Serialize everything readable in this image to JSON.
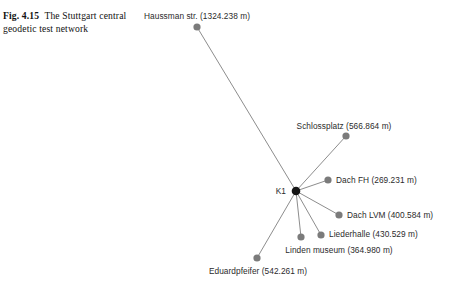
{
  "figure": {
    "label": "Fig. 4.15",
    "caption": "The Stuttgart central geodetic test network",
    "caption_line1": "The Stuttgart",
    "caption_line2": "central geodetic test network"
  },
  "colors": {
    "background": "#ffffff",
    "node": "#7b7b7b",
    "center_node": "#151515",
    "edge": "#8d8d8d",
    "label_text": "#2b2b2b",
    "caption_text": "#111111"
  },
  "chart_data": {
    "type": "scatter",
    "title": "The Stuttgart central geodetic test network",
    "xlabel": "",
    "ylabel": "",
    "legend": "none",
    "grid": false,
    "units": "m",
    "center_station": {
      "name": "K1",
      "label": "K1",
      "x": 296,
      "y": 191
    },
    "stations": [
      {
        "name": "Haussman str.",
        "distance_m": 1324.238,
        "label": "Haussman str. (1324.238 m)",
        "x": 197,
        "y": 27,
        "label_x": 197,
        "label_y": 16,
        "label_align": "center"
      },
      {
        "name": "Schlossplatz",
        "distance_m": 566.864,
        "label": "Schlossplatz (566.864 m)",
        "x": 346,
        "y": 136,
        "label_x": 344,
        "label_y": 126,
        "label_align": "center"
      },
      {
        "name": "Dach FH",
        "distance_m": 269.231,
        "label": "Dach FH (269.231 m)",
        "x": 328,
        "y": 180,
        "label_x": 336,
        "label_y": 180,
        "label_align": "right"
      },
      {
        "name": "Dach LVM",
        "distance_m": 400.584,
        "label": "Dach LVM (400.584 m)",
        "x": 339,
        "y": 215,
        "label_x": 347,
        "label_y": 215,
        "label_align": "right"
      },
      {
        "name": "Liederhalle",
        "distance_m": 430.529,
        "label": "Liederhalle (430.529 m)",
        "x": 321,
        "y": 235,
        "label_x": 329,
        "label_y": 234,
        "label_align": "right"
      },
      {
        "name": "Linden museum",
        "distance_m": 364.98,
        "label": "Linden museum (364.980 m)",
        "x": 301,
        "y": 237,
        "label_x": 339,
        "label_y": 250,
        "label_align": "center"
      },
      {
        "name": "Eduardpfeifer",
        "distance_m": 542.261,
        "label": "Eduardpfeifer (542.261 m)",
        "x": 257,
        "y": 258,
        "label_x": 258,
        "label_y": 271,
        "label_align": "center"
      }
    ],
    "edges": [
      {
        "from": "K1",
        "to": "Haussman str."
      },
      {
        "from": "K1",
        "to": "Schlossplatz"
      },
      {
        "from": "K1",
        "to": "Dach FH"
      },
      {
        "from": "K1",
        "to": "Dach LVM"
      },
      {
        "from": "K1",
        "to": "Liederhalle"
      },
      {
        "from": "K1",
        "to": "Linden museum"
      },
      {
        "from": "K1",
        "to": "Eduardpfeifer"
      }
    ]
  }
}
